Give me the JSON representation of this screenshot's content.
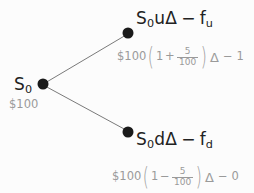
{
  "diagram": {
    "type": "binomial-option-tree",
    "background_color": "#fcfcfc",
    "node_color": "#1a1a1a",
    "edge_color": "#7a7a7a",
    "label_color": "#222222",
    "sublabel_color": "#9a9a9a",
    "nodes": [
      {
        "id": "root",
        "label": "S",
        "label_sub": "0",
        "sublabel": "$100",
        "x": 43,
        "y": 84
      },
      {
        "id": "up",
        "label_parts": [
          "S",
          "0",
          "u",
          "Δ",
          "−",
          "f",
          "u"
        ],
        "label_text": "S₀uΔ − fᵤ",
        "x": 128,
        "y": 33
      },
      {
        "id": "down",
        "label_parts": [
          "S",
          "0",
          "d",
          "Δ",
          "−",
          "f",
          "d"
        ],
        "label_text": "S₀dΔ − f_d",
        "x": 128,
        "y": 132
      }
    ],
    "edges": [
      {
        "from": "root",
        "to": "up"
      },
      {
        "from": "root",
        "to": "down"
      }
    ],
    "labels": {
      "root_symbol": "S",
      "root_subscript": "0",
      "root_value": "$100",
      "up_symbol": "S",
      "up_subscript": "0",
      "up_factor": "u",
      "up_delta": "Δ",
      "up_minus": "−",
      "up_f": "f",
      "up_f_subscript": "u",
      "down_symbol": "S",
      "down_subscript": "0",
      "down_factor": "d",
      "down_delta": "Δ",
      "down_minus": "−",
      "down_f": "f",
      "down_f_subscript": "d"
    },
    "formulas": {
      "up": {
        "currency": "$100",
        "open_paren": "(",
        "one": "1",
        "operator": "+",
        "numerator": "5",
        "denominator": "100",
        "close_paren": ")",
        "delta": "Δ",
        "minus": "−",
        "payoff": "1",
        "text": "$100(1 + 5/100)Δ − 1"
      },
      "down": {
        "currency": "$100",
        "open_paren": "(",
        "one": "1",
        "operator": "−",
        "numerator": "5",
        "denominator": "100",
        "close_paren": ")",
        "delta": "Δ",
        "minus": "−",
        "payoff": "0",
        "text": "$100(1 − 5/100)Δ − 0"
      }
    }
  }
}
